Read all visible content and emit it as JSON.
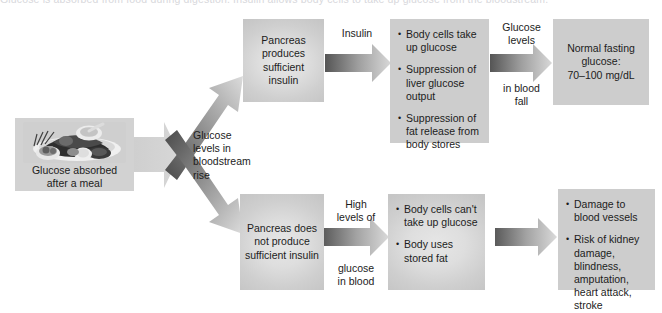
{
  "figure": {
    "clipped_top_caption": "Glucose is absorbed from food during digestion. Insulin allows body cells to take up glucose from the bloodstream.",
    "background_color": "#ffffff",
    "node_color": "#cfcfcf",
    "arrow_dark": "#4f4f4f",
    "arrow_light": "#d9d9d9"
  },
  "nodes": {
    "meal": {
      "caption_line1": "Glucose absorbed",
      "caption_line2": "after a meal",
      "photo_alt": "plate-of-food"
    },
    "pancreas_sufficient": {
      "text": "Pancreas\nproduces\nsufficient\ninsulin"
    },
    "pancreas_insufficient": {
      "text": "Pancreas does\nnot produce\nsufficient insulin"
    },
    "normal_effects": {
      "bullets": [
        "Body cells take up glucose",
        "Suppression of liver glucose output",
        "Suppression of fat release from body stores"
      ]
    },
    "diabetic_effects": {
      "bullets": [
        "Body cells can't take up glucose",
        "Body uses stored fat"
      ]
    },
    "normal_outcome": {
      "text": "Normal fasting\nglucose:\n70–100 mg/dL"
    },
    "diabetic_outcome": {
      "bullets": [
        "Damage to blood vessels",
        "Risk of kidney damage, blindness, amputation, heart attack, stroke"
      ]
    }
  },
  "connectors": {
    "split_label": "Glucose\nlevels in\nbloodstream\nrise",
    "insulin_label": "Insulin",
    "glucose_levels_label": "Glucose\nlevels",
    "in_blood_fall_label": "in blood\nfall",
    "high_levels_label": "High\nlevels of",
    "glucose_in_blood_label": "glucose\nin blood"
  }
}
